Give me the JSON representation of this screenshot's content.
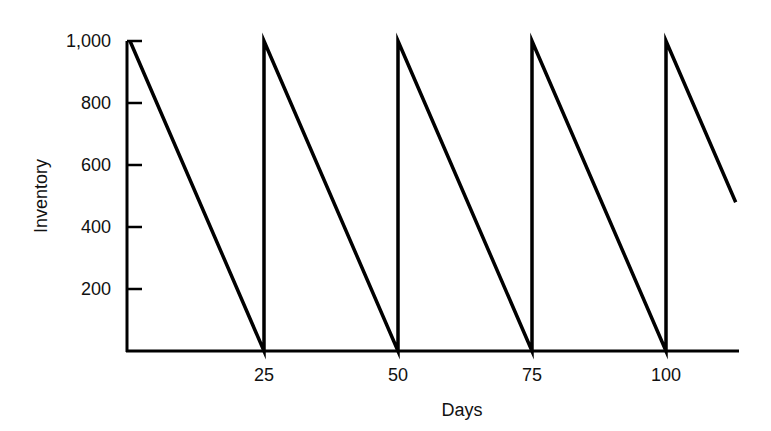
{
  "chart_data": {
    "type": "line",
    "title": "",
    "xlabel": "Days",
    "ylabel": "Inventory",
    "xlim": [
      0,
      113
    ],
    "ylim": [
      0,
      1000
    ],
    "grid": false,
    "legend": null,
    "x_ticks": [
      25,
      50,
      75,
      100
    ],
    "x_tick_labels": [
      "25",
      "50",
      "75",
      "100"
    ],
    "y_ticks": [
      200,
      400,
      600,
      800,
      1000
    ],
    "y_tick_labels": [
      "200",
      "400",
      "600",
      "800",
      "1,000"
    ],
    "series": [
      {
        "name": "Inventory",
        "points": [
          [
            0,
            1000
          ],
          [
            25,
            0
          ],
          [
            25,
            1000
          ],
          [
            50,
            0
          ],
          [
            50,
            1000
          ],
          [
            75,
            0
          ],
          [
            75,
            1000
          ],
          [
            100,
            0
          ],
          [
            100,
            1000
          ],
          [
            113,
            480
          ]
        ]
      }
    ],
    "annotations": [],
    "colors": {
      "line": "#000000",
      "axis": "#000000"
    }
  }
}
